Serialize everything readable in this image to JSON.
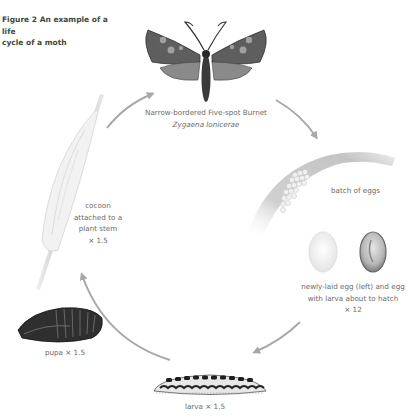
{
  "figure": {
    "title_line1": "Figure 2 An example of a life",
    "title_line2": "cycle of a moth"
  },
  "stages": {
    "adult": {
      "common_name": "Narrow-bordered Five-spot Burnet",
      "scientific_name": "Zygaena lonicerae"
    },
    "egg_batch": {
      "label": "batch of eggs"
    },
    "eggs": {
      "line1": "newly-laid egg (left) and egg",
      "line2": "with larva about to hatch",
      "magnification": "× 12"
    },
    "larva": {
      "label": "larva × 1.5"
    },
    "pupa": {
      "label": "pupa × 1.5"
    },
    "cocoon": {
      "line1": "cocoon",
      "line2": "attached to a",
      "line3": "plant stem",
      "magnification": "× 1.5"
    }
  },
  "colors": {
    "arrow": "#a8a8a8",
    "moth_wing": "#555555",
    "text": "#6a6a6a"
  }
}
